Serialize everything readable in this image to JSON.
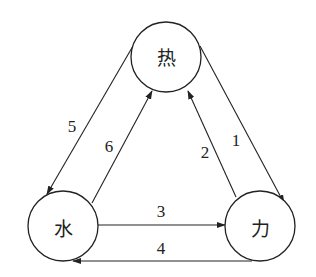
{
  "diagram": {
    "type": "cycle-graph",
    "nodes": [
      {
        "id": "heat",
        "label": "热"
      },
      {
        "id": "water",
        "label": "水"
      },
      {
        "id": "force",
        "label": "力"
      }
    ],
    "edges": [
      {
        "id": "e1",
        "label": "1",
        "from": "heat",
        "to": "force"
      },
      {
        "id": "e2",
        "label": "2",
        "from": "force",
        "to": "heat"
      },
      {
        "id": "e3",
        "label": "3",
        "from": "water",
        "to": "force"
      },
      {
        "id": "e4",
        "label": "4",
        "from": "force",
        "to": "water"
      },
      {
        "id": "e5",
        "label": "5",
        "from": "heat",
        "to": "water"
      },
      {
        "id": "e6",
        "label": "6",
        "from": "water",
        "to": "heat"
      }
    ]
  }
}
